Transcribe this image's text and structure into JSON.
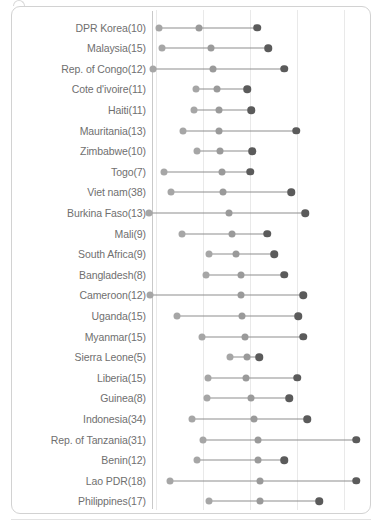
{
  "chart_data": {
    "type": "scatter",
    "subtype": "dumbbell-range-plot",
    "title": "",
    "xlabel": "",
    "ylabel": "",
    "grid": true,
    "legend": null,
    "axis": {
      "gridline_pixels": [
        155,
        202,
        249,
        296,
        343
      ],
      "plot_left_px": 151,
      "plot_right_px": 358
    },
    "series": [
      {
        "name": "low",
        "color": "#a6a6a6"
      },
      {
        "name": "mid",
        "color": "#9a9a9a"
      },
      {
        "name": "high",
        "color": "#5b5b5b"
      }
    ],
    "categories": [
      "DPR Korea(10)",
      "Malaysia(15)",
      "Rep. of Congo(12)",
      "Cote d'ivoire(11)",
      "Haiti(11)",
      "Mauritania(13)",
      "Zimbabwe(10)",
      "Togo(7)",
      "Viet nam(38)",
      "Burkina Faso(13)",
      "Mali(9)",
      "South Africa(9)",
      "Bangladesh(8)",
      "Cameroon(12)",
      "Uganda(15)",
      "Myanmar(15)",
      "Sierra Leone(5)",
      "Liberia(15)",
      "Guinea(8)",
      "Indonesia(34)",
      "Rep. of Tanzania(31)",
      "Benin(12)",
      "Lao PDR(18)",
      "Philippines(17)"
    ],
    "rows": [
      {
        "label": "DPR Korea(10)",
        "low": 158,
        "mid": 198,
        "high": 256
      },
      {
        "label": "Malaysia(15)",
        "low": 161,
        "mid": 210,
        "high": 267
      },
      {
        "label": "Rep. of Congo(12)",
        "low": 152,
        "mid": 212,
        "high": 283
      },
      {
        "label": "Cote d'ivoire(11)",
        "low": 195,
        "mid": 216,
        "high": 246
      },
      {
        "label": "Haiti(11)",
        "low": 193,
        "mid": 218,
        "high": 250
      },
      {
        "label": "Mauritania(13)",
        "low": 182,
        "mid": 218,
        "high": 295
      },
      {
        "label": "Zimbabwe(10)",
        "low": 196,
        "mid": 219,
        "high": 251
      },
      {
        "label": "Togo(7)",
        "low": 163,
        "mid": 221,
        "high": 249
      },
      {
        "label": "Viet nam(38)",
        "low": 170,
        "mid": 222,
        "high": 290
      },
      {
        "label": "Burkina Faso(13)",
        "low": 148,
        "mid": 228,
        "high": 304
      },
      {
        "label": "Mali(9)",
        "low": 181,
        "mid": 231,
        "high": 266
      },
      {
        "label": "South Africa(9)",
        "low": 208,
        "mid": 235,
        "high": 273
      },
      {
        "label": "Bangladesh(8)",
        "low": 205,
        "mid": 240,
        "high": 283
      },
      {
        "label": "Cameroon(12)",
        "low": 149,
        "mid": 240,
        "high": 302
      },
      {
        "label": "Uganda(15)",
        "low": 176,
        "mid": 241,
        "high": 297
      },
      {
        "label": "Myanmar(15)",
        "low": 201,
        "mid": 244,
        "high": 302
      },
      {
        "label": "Sierra Leone(5)",
        "low": 229,
        "mid": 246,
        "high": 258
      },
      {
        "label": "Liberia(15)",
        "low": 207,
        "mid": 245,
        "high": 296
      },
      {
        "label": "Guinea(8)",
        "low": 206,
        "mid": 250,
        "high": 288
      },
      {
        "label": "Indonesia(34)",
        "low": 191,
        "mid": 253,
        "high": 306
      },
      {
        "label": "Rep. of Tanzania(31)",
        "low": 202,
        "mid": 257,
        "high": 355
      },
      {
        "label": "Benin(12)",
        "low": 196,
        "mid": 257,
        "high": 283
      },
      {
        "label": "Lao PDR(18)",
        "low": 169,
        "mid": 259,
        "high": 355
      },
      {
        "label": "Philippines(17)",
        "low": 208,
        "mid": 259,
        "high": 318
      }
    ]
  }
}
